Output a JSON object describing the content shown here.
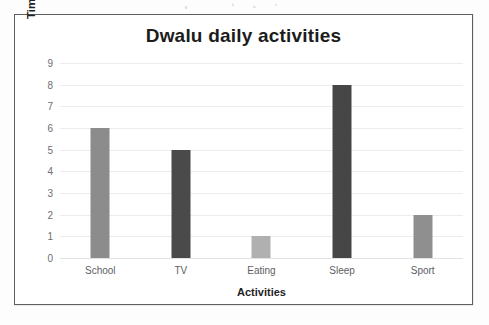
{
  "chart_data": {
    "type": "bar",
    "title": "Dwalu daily activities",
    "xlabel": "Activities",
    "ylabel": "Time in hours",
    "categories": [
      "School",
      "TV",
      "Eating",
      "Sleep",
      "Sport"
    ],
    "values": [
      6,
      5,
      1,
      8,
      2
    ],
    "ylim": [
      0,
      9
    ],
    "yticks": [
      0,
      1,
      2,
      3,
      4,
      5,
      6,
      7,
      8,
      9
    ],
    "ytick_labels": [
      "0",
      "1",
      "2",
      "3",
      "4",
      "5",
      "6",
      "7",
      "8",
      "9"
    ],
    "grid": "horizontal",
    "legend": "none",
    "bar_colors": [
      "#8c8c8c",
      "#4a4a4a",
      "#b0b0b0",
      "#464646",
      "#8f8f8f"
    ],
    "bars": [
      {
        "category": "School",
        "value": 6,
        "color": "#8c8c8c"
      },
      {
        "category": "TV",
        "value": 5,
        "color": "#4a4a4a"
      },
      {
        "category": "Eating",
        "value": 1,
        "color": "#b0b0b0"
      },
      {
        "category": "Sleep",
        "value": 8,
        "color": "#464646"
      },
      {
        "category": "Sport",
        "value": 2,
        "color": "#8f8f8f"
      }
    ]
  },
  "style": {
    "frame_border_color": "#5f5f62",
    "gridline_color": "#ececee",
    "title_color": "#1c1c1c",
    "tick_label_color": "#6e6e72",
    "axis_title_color": "#1f1f1f",
    "plot_background": "#ffffff"
  }
}
